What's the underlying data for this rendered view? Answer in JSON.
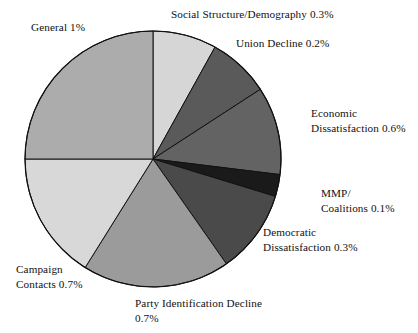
{
  "chart_data": {
    "type": "pie",
    "title": "",
    "subtitle": "",
    "xlabel": "",
    "ylabel": "",
    "legend_position": "none",
    "grid": false,
    "units": "percent",
    "note": "Slice label text shows each category's percentage value as printed on the figure.",
    "center": {
      "x": 153,
      "y": 159,
      "radius": 128
    },
    "start_angle_deg": 0,
    "direction": "clockwise",
    "categories": [
      "Social Structure/Demography",
      "Union Decline",
      "Economic Dissatisfaction",
      "MMP/Coalitions",
      "Democratic Dissatisfaction",
      "Party Identification Decline",
      "Campaign Contacts",
      "General"
    ],
    "values": [
      0.3,
      0.2,
      0.6,
      0.1,
      0.3,
      0.7,
      0.7,
      1.0
    ],
    "value_texts": [
      "0.3%",
      "0.2%",
      "0.6%",
      "0.1%",
      "0.3%",
      "0.7%",
      "0.7%",
      "1%"
    ],
    "slices": [
      {
        "name": "Social Structure/Demography",
        "value": 0.3,
        "value_text": "0.3%",
        "color": "#d6d6d6",
        "start_deg": 0,
        "end_deg": 29
      },
      {
        "name": "Union Decline",
        "value": 0.2,
        "value_text": "0.2%",
        "color": "#5a5a5a",
        "start_deg": 29,
        "end_deg": 57
      },
      {
        "name": "Economic Dissatisfaction",
        "value": 0.6,
        "value_text": "0.6%",
        "color": "#636363",
        "start_deg": 57,
        "end_deg": 97
      },
      {
        "name": "MMP/Coalitions",
        "value": 0.1,
        "value_text": "0.1%",
        "color": "#1a1a1a",
        "start_deg": 97,
        "end_deg": 107
      },
      {
        "name": "Democratic Dissatisfaction",
        "value": 0.3,
        "value_text": "0.3%",
        "color": "#4a4a4a",
        "start_deg": 107,
        "end_deg": 145
      },
      {
        "name": "Party Identification Decline",
        "value": 0.7,
        "value_text": "0.7%",
        "color": "#9b9b9b",
        "start_deg": 145,
        "end_deg": 212
      },
      {
        "name": "Campaign Contacts",
        "value": 0.7,
        "value_text": "0.7%",
        "color": "#d8d8d8",
        "start_deg": 212,
        "end_deg": 270
      },
      {
        "name": "General",
        "value": 1.0,
        "value_text": "1%",
        "color": "#acacac",
        "start_deg": 270,
        "end_deg": 360
      }
    ]
  },
  "labels": {
    "general": "General 1%",
    "social_structure": "Social Structure/Demography 0.3%",
    "union_decline": "Union Decline 0.2%",
    "economic": "Economic\nDissatisfaction 0.6%",
    "mmp": "MMP/\nCoalitions 0.1%",
    "democratic": "Democratic\nDissatisfaction 0.3%",
    "party_id": "Party Identification Decline\n0.7%",
    "campaign": "Campaign\nContacts 0.7%"
  },
  "style": {
    "background": "#ffffff",
    "text_color": "#111111",
    "slice_outline": "#111111"
  }
}
